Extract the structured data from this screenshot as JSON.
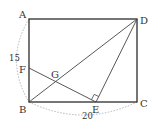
{
  "diagram": {
    "type": "geometry",
    "colors": {
      "line": "#2b2b2b",
      "dotted": "#b5b5b5",
      "text": "#333333"
    },
    "points": {
      "A": {
        "label": "A",
        "x": 29,
        "y": 19
      },
      "B": {
        "label": "B",
        "x": 29,
        "y": 102
      },
      "C": {
        "label": "C",
        "x": 137,
        "y": 102
      },
      "D": {
        "label": "D",
        "x": 137,
        "y": 19
      },
      "E": {
        "label": "E",
        "x": 96,
        "y": 102
      },
      "F": {
        "label": "F",
        "x": 29,
        "y": 68
      },
      "G": {
        "label": "G",
        "x": 56,
        "y": 80
      }
    },
    "segments": [
      "AB",
      "BC",
      "CD",
      "DA",
      "BD",
      "DE",
      "FE"
    ],
    "right_angle_at": "E",
    "dimensions": [
      {
        "label": "15",
        "between": "A-B",
        "style": "dotted-arc"
      },
      {
        "label": "20",
        "between": "B-C",
        "style": "dotted-arc"
      }
    ]
  }
}
